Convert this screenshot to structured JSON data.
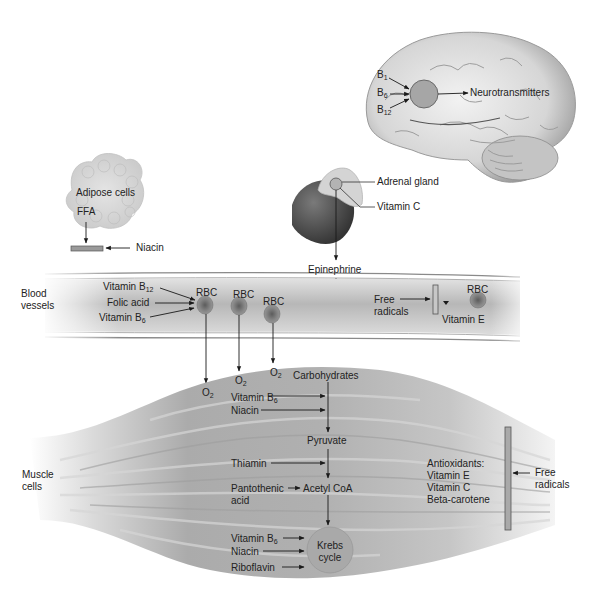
{
  "diagram": {
    "brain": {
      "inputs": [
        {
          "base": "B",
          "sub": "1"
        },
        {
          "base": "B",
          "sub": "6"
        },
        {
          "base": "B",
          "sub": "12"
        }
      ],
      "output": "Neurotransmitters"
    },
    "adipose": {
      "label": "Adipose cells",
      "ffa": "FFA",
      "inhibitor": "Niacin"
    },
    "adrenal": {
      "gland_label": "Adrenal gland",
      "vitamin_label": "Vitamin C",
      "output": "Epinephrine"
    },
    "blood_vessel": {
      "label_line1": "Blood",
      "label_line2": "vessels",
      "inputs": [
        {
          "base": "Vitamin B",
          "sub": "12"
        },
        {
          "base": "Folic acid",
          "sub": ""
        },
        {
          "base": "Vitamin B",
          "sub": "6"
        }
      ],
      "rbc_label": "RBC",
      "free_radicals_line1": "Free",
      "free_radicals_line2": "radicals",
      "vitamin_e": "Vitamin E"
    },
    "oxygen": {
      "base": "O",
      "sub": "2"
    },
    "muscle": {
      "label_line1": "Muscle",
      "label_line2": "cells",
      "pathway": {
        "carbohydrates": "Carbohydrates",
        "pyruvate": "Pyruvate",
        "acetyl_coa": "Acetyl CoA",
        "krebs_line1": "Krebs",
        "krebs_line2": "cycle"
      },
      "cofactors_to_pyruvate": [
        {
          "base": "Vitamin B",
          "sub": "6"
        },
        {
          "base": "Niacin",
          "sub": ""
        }
      ],
      "cofactor_to_acetyl": "Thiamin",
      "pantothenic_line1": "Pantothenic",
      "pantothenic_line2": "acid",
      "cofactors_to_krebs": [
        {
          "base": "Vitamin B",
          "sub": "6"
        },
        {
          "base": "Niacin",
          "sub": ""
        },
        {
          "base": "Riboflavin",
          "sub": ""
        }
      ],
      "antioxidants": {
        "title": "Antioxidants:",
        "items": [
          "Vitamin E",
          "Vitamin C",
          "Beta-carotene"
        ]
      },
      "free_radicals_line1": "Free",
      "free_radicals_line2": "radicals"
    },
    "colors": {
      "circle_fill": "#a9a9a9",
      "circle_stroke": "#6f6f6f",
      "muscle_fill": "#b5b5b5",
      "vessel_fill": "#c9c9c9",
      "rbc_fill": "#7a7a7a",
      "arrow": "#1a1a1a"
    }
  }
}
